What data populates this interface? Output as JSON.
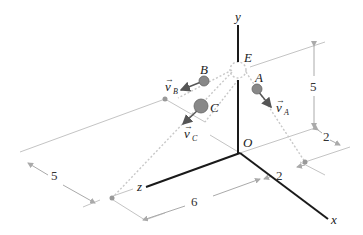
{
  "figure": {
    "type": "3d-coordinate-diagram",
    "axes": {
      "x": "x",
      "y": "y",
      "z": "z",
      "origin": "O"
    },
    "points": {
      "E": "E",
      "A": "A",
      "B": "B",
      "C": "C"
    },
    "velocities": {
      "A": {
        "symbol": "v",
        "sub": "A"
      },
      "B": {
        "symbol": "v",
        "sub": "B"
      },
      "C": {
        "symbol": "v",
        "sub": "C"
      }
    },
    "dimensions": {
      "height_right": "5",
      "offset_right_top": "2",
      "offset_right_bottom": "2",
      "left_width": "5",
      "bottom_length": "6"
    },
    "colors": {
      "axis": "#1a1a1a",
      "guide": "#bdbdbd",
      "ball": "#888888",
      "dotted": "#c8c8c8"
    }
  }
}
